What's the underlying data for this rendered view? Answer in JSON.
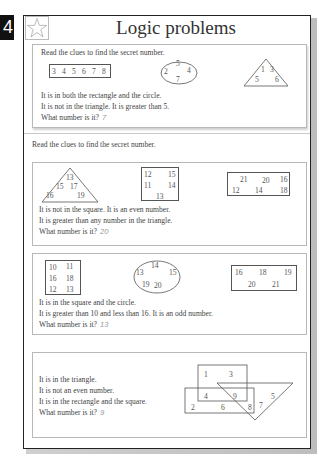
{
  "page": {
    "number": "4",
    "title": "Logic problems",
    "icon": "star-icon"
  },
  "example": {
    "instruction": "Read the clues to find the secret number.",
    "rectangle": [
      "3",
      "4",
      "5",
      "6",
      "7",
      "8"
    ],
    "circle": [
      "5",
      "2",
      "4",
      "7"
    ],
    "triangle": [
      "1",
      "3",
      "5",
      "6"
    ],
    "clues": [
      "It is in both the rectangle and the circle.",
      "It is not in the triangle. It is greater than 5.",
      "What number is it?"
    ],
    "answer": "7"
  },
  "section_instruction": "Read the clues to find the secret number.",
  "problems": [
    {
      "triangle": [
        "13",
        "15",
        "17",
        "16",
        "19"
      ],
      "square": [
        "12",
        "15",
        "11",
        "14",
        "13"
      ],
      "rectangle": [
        "21",
        "20",
        "16",
        "12",
        "14",
        "18"
      ],
      "clues": [
        "It is not in the square. It is an even number.",
        "It is greater than any number in the triangle.",
        "What number is it?"
      ],
      "answer": "20"
    },
    {
      "square": [
        "10",
        "11",
        "16",
        "18",
        "12",
        "13"
      ],
      "circle": [
        "14",
        "13",
        "15",
        "19",
        "20"
      ],
      "rectangle": [
        "16",
        "18",
        "19",
        "20",
        "21"
      ],
      "clues": [
        "It is in the square and the circle.",
        "It is greater than 10 and less than 16. It is an odd number.",
        "What number is it?"
      ],
      "answer": "13"
    },
    {
      "venn": {
        "square": [
          "1",
          "3"
        ],
        "overlap_square_rect": [
          "4"
        ],
        "overlap_all": [
          "9"
        ],
        "rectangle": [
          "2",
          "6"
        ],
        "rect_triangle": [
          "8"
        ],
        "triangle": [
          "7",
          "5"
        ]
      },
      "clues": [
        "It is in the triangle.",
        "It is not an even number.",
        "It is in the rectangle and the square.",
        "What number is it?"
      ],
      "answer": "9"
    }
  ]
}
